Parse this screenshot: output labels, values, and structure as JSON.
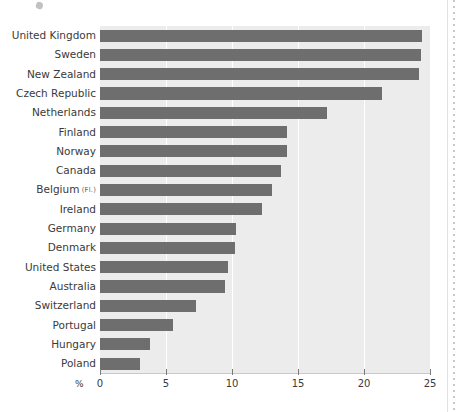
{
  "chart_data": {
    "type": "bar",
    "orientation": "horizontal",
    "title": "",
    "subtitle": "",
    "xlabel": "%",
    "ylabel": "",
    "xlim": [
      0,
      25
    ],
    "xticks": [
      0,
      5,
      10,
      15,
      20,
      25
    ],
    "xtick_labels": [
      "0",
      "5",
      "10",
      "15",
      "20",
      "25"
    ],
    "grid": "vertical-white",
    "legend": "none",
    "bar_color": "#6e6e6e",
    "plot_background": "#ececec",
    "page_background": "#ffffff",
    "categories": [
      "United Kingdom",
      "Sweden",
      "New Zealand",
      "Czech Republic",
      "Netherlands",
      "Finland",
      "Norway",
      "Canada",
      "Belgium",
      "Ireland",
      "Germany",
      "Denmark",
      "United States",
      "Australia",
      "Switzerland",
      "Portugal",
      "Hungary",
      "Poland"
    ],
    "category_notes": [
      "",
      "",
      "",
      "",
      "",
      "",
      "",
      "",
      "(Fl.)",
      "",
      "",
      "",
      "",
      "",
      "",
      "",
      "",
      ""
    ],
    "values": [
      24.4,
      24.3,
      24.2,
      21.4,
      17.2,
      14.2,
      14.2,
      13.7,
      13.0,
      12.3,
      10.3,
      10.2,
      9.7,
      9.5,
      7.3,
      5.5,
      3.8,
      3.0
    ]
  },
  "annotations": {
    "scan_speck": "scan-speck",
    "scan_edge": "scan-edge"
  }
}
